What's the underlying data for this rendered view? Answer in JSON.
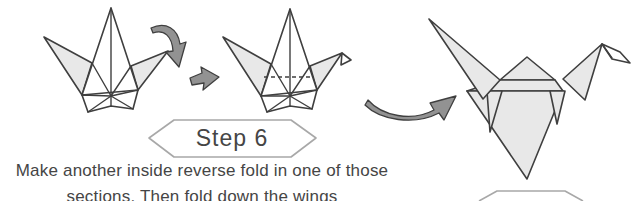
{
  "colors": {
    "background": "#ffffff",
    "outline": "#3f3f3f",
    "shade": "#e8e8e8",
    "arrow_fill": "#929292",
    "badge_border": "#a8a8a8",
    "text": "#454545"
  },
  "step_badge": {
    "label": "Step 6"
  },
  "caption": {
    "line1": "Make another inside reverse fold in one of those",
    "line2": "sections. Then fold down the wings"
  }
}
